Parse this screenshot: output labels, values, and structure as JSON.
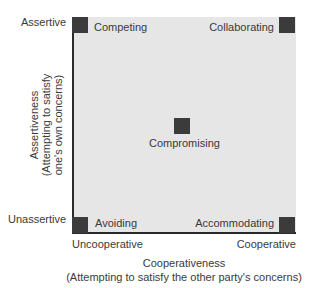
{
  "diagram": {
    "type": "conflict-handling-styles-grid",
    "y_axis": {
      "title": "Assertiveness",
      "subtitle": "(Attempting to satisfy",
      "subtitle2": "one's own concerns)",
      "high_label": "Assertive",
      "low_label": "Unassertive"
    },
    "x_axis": {
      "title": "Cooperativeness",
      "subtitle": "(Attempting to satisfy the other party's concerns)",
      "low_label": "Uncooperative",
      "high_label": "Cooperative"
    },
    "styles": [
      {
        "name": "Competing",
        "assertiveness": "high",
        "cooperativeness": "low"
      },
      {
        "name": "Collaborating",
        "assertiveness": "high",
        "cooperativeness": "high"
      },
      {
        "name": "Compromising",
        "assertiveness": "medium",
        "cooperativeness": "medium"
      },
      {
        "name": "Avoiding",
        "assertiveness": "low",
        "cooperativeness": "low"
      },
      {
        "name": "Accommodating",
        "assertiveness": "low",
        "cooperativeness": "high"
      }
    ],
    "colors": {
      "background": "#e6e6e6",
      "marker": "#3b3b3b",
      "axis": "#2a2a2a",
      "text": "#3a3a3a"
    }
  }
}
